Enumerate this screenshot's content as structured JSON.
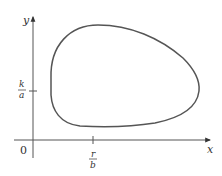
{
  "figure": {
    "type": "phase-plane closed orbit",
    "axes": {
      "x_label": "x",
      "y_label": "y",
      "origin_label": "0"
    },
    "ticks": {
      "x_tick": {
        "numerator": "r",
        "denominator": "b"
      },
      "y_tick": {
        "numerator": "k",
        "denominator": "a"
      }
    },
    "colors": {
      "curve": "#555555",
      "axes": "#555555",
      "text": "#333333",
      "background": "#ffffff"
    }
  }
}
